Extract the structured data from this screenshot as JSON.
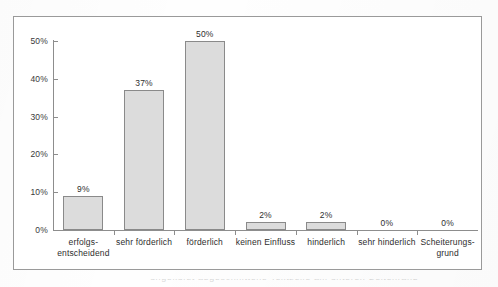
{
  "figure": {
    "frame_border_color": "#9a9a9a",
    "background_color": "#ffffff"
  },
  "chart_data": {
    "type": "bar",
    "title": "",
    "subtitle": "",
    "xlabel": "",
    "ylabel": "",
    "categories": [
      "erfolgs-\nentscheidend",
      "sehr förderlich",
      "förderlich",
      "keinen Einfluss",
      "hinderlich",
      "sehr hinderlich",
      "Scheiterungs-\ngrund"
    ],
    "category_lines": [
      [
        "erfolgs-",
        "entscheidend"
      ],
      [
        "sehr förderlich"
      ],
      [
        "förderlich"
      ],
      [
        "keinen Einfluss"
      ],
      [
        "hinderlich"
      ],
      [
        "sehr hinderlich"
      ],
      [
        "Scheiterungs-",
        "grund"
      ]
    ],
    "values": [
      9,
      37,
      50,
      2,
      2,
      0,
      0
    ],
    "value_labels": [
      "9%",
      "37%",
      "50%",
      "2%",
      "2%",
      "0%",
      "0%"
    ],
    "ylim": [
      0,
      50
    ],
    "ytick_values": [
      0,
      10,
      20,
      30,
      40,
      50
    ],
    "ytick_labels": [
      "0%",
      "10%",
      "20%",
      "30%",
      "40%",
      "50%"
    ],
    "grid": false,
    "legend": null,
    "legend_position": "none",
    "bar_fill_color": "#dcdcdc",
    "bar_border_color": "#8a8a8a",
    "axis_color": "#8d8d8d",
    "text_color": "#2e2e2e"
  },
  "scan": {
    "bottom_artifact_text": "ungekürzt abgeschnittene Textzeile am unteren Seitenrand"
  }
}
